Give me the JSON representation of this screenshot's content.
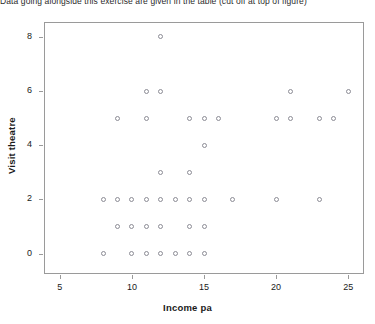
{
  "caption": {
    "text": "Data going alongside this exercise are given in the table (cut off at top of figure)"
  },
  "chart_data": {
    "type": "scatter",
    "title": "",
    "xlabel": "Income pa",
    "ylabel": "Visit theatre",
    "xlim": [
      3.9,
      26.1
    ],
    "ylim": [
      -0.75,
      8.55
    ],
    "xticks": [
      5,
      10,
      15,
      20,
      25
    ],
    "yticks": [
      0,
      2,
      4,
      6,
      8
    ],
    "xtick_labels": [
      "5",
      "10",
      "15",
      "20",
      "25"
    ],
    "ytick_labels": [
      "0",
      "2",
      "4",
      "6",
      "8"
    ],
    "grid": false,
    "legend": "none",
    "marker": "open-circle",
    "marker_color": "#8c8c95",
    "points": [
      {
        "x": 12,
        "y": 8
      },
      {
        "x": 11,
        "y": 6
      },
      {
        "x": 12,
        "y": 6
      },
      {
        "x": 21,
        "y": 6
      },
      {
        "x": 25,
        "y": 6
      },
      {
        "x": 9,
        "y": 5
      },
      {
        "x": 11,
        "y": 5
      },
      {
        "x": 14,
        "y": 5
      },
      {
        "x": 15,
        "y": 5
      },
      {
        "x": 16,
        "y": 5
      },
      {
        "x": 20,
        "y": 5
      },
      {
        "x": 21,
        "y": 5
      },
      {
        "x": 23,
        "y": 5
      },
      {
        "x": 24,
        "y": 5
      },
      {
        "x": 15,
        "y": 4
      },
      {
        "x": 12,
        "y": 3
      },
      {
        "x": 14,
        "y": 3
      },
      {
        "x": 8,
        "y": 2
      },
      {
        "x": 9,
        "y": 2
      },
      {
        "x": 10,
        "y": 2
      },
      {
        "x": 11,
        "y": 2
      },
      {
        "x": 12,
        "y": 2
      },
      {
        "x": 13,
        "y": 2
      },
      {
        "x": 14,
        "y": 2
      },
      {
        "x": 15,
        "y": 2
      },
      {
        "x": 17,
        "y": 2
      },
      {
        "x": 20,
        "y": 2
      },
      {
        "x": 23,
        "y": 2
      },
      {
        "x": 9,
        "y": 1
      },
      {
        "x": 10,
        "y": 1
      },
      {
        "x": 11,
        "y": 1
      },
      {
        "x": 12,
        "y": 1
      },
      {
        "x": 14,
        "y": 1
      },
      {
        "x": 15,
        "y": 1
      },
      {
        "x": 8,
        "y": 0
      },
      {
        "x": 10,
        "y": 0
      },
      {
        "x": 11,
        "y": 0
      },
      {
        "x": 12,
        "y": 0
      },
      {
        "x": 13,
        "y": 0
      },
      {
        "x": 14,
        "y": 0
      },
      {
        "x": 15,
        "y": 0
      }
    ]
  }
}
